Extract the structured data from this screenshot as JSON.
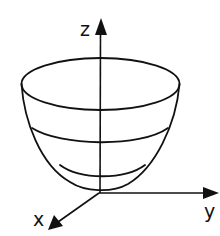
{
  "diagram": {
    "type": "paraboloid-surface",
    "colors": {
      "stroke": "#111111",
      "background": "#ffffff"
    },
    "axes": {
      "z": {
        "label": "z"
      },
      "y": {
        "label": "y"
      },
      "x": {
        "label": "x"
      }
    },
    "level_curves": 3
  }
}
